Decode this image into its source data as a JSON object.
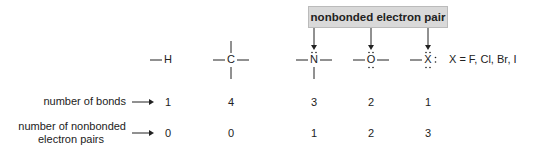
{
  "callout": {
    "label": "nonbonded electron pair"
  },
  "atoms": [
    {
      "symbol": "H",
      "bonds": "1",
      "lone_pairs": "0"
    },
    {
      "symbol": "C",
      "bonds": "4",
      "lone_pairs": "0"
    },
    {
      "symbol": "N",
      "bonds": "3",
      "lone_pairs": "1"
    },
    {
      "symbol": "O",
      "bonds": "2",
      "lone_pairs": "2"
    },
    {
      "symbol": "X",
      "bonds": "1",
      "lone_pairs": "3"
    }
  ],
  "halogen_note": "X = F, Cl, Br, I",
  "rows": {
    "bonds_label": "number of bonds",
    "lone_pairs_label_line1": "number of nonbonded",
    "lone_pairs_label_line2": "electron pairs"
  },
  "colors": {
    "callout_bg": "#d9d9d9",
    "ink": "#222222"
  }
}
